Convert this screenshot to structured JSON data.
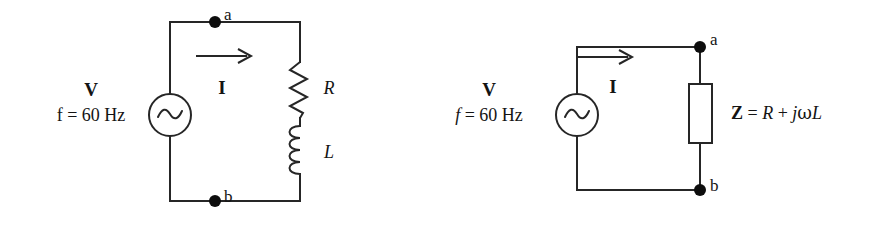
{
  "figure": {
    "type": "circuit-diagram",
    "width": 869,
    "height": 230,
    "background_color": "#ffffff",
    "line_color": "#262626",
    "text_color": "#141414"
  },
  "circuit_left": {
    "name": "series-r-l-circuit",
    "source": {
      "symbol": "ac-source",
      "voltage_label": "V",
      "frequency_label_prefix": "f",
      "frequency_label_equals": "=",
      "frequency_label_value": "60 Hz",
      "frequency_label_full": "f = 60 Hz",
      "frequency_italic_f": false
    },
    "current": {
      "label": "I",
      "arrow_direction": "right"
    },
    "nodes": [
      {
        "label": "a",
        "position": "top"
      },
      {
        "label": "b",
        "position": "bottom"
      }
    ],
    "components": [
      {
        "symbol": "resistor",
        "label": "R"
      },
      {
        "symbol": "inductor",
        "label": "L"
      }
    ]
  },
  "circuit_right": {
    "name": "equivalent-impedance-circuit",
    "source": {
      "symbol": "ac-source",
      "voltage_label": "V",
      "frequency_label_prefix": "f",
      "frequency_label_equals": "=",
      "frequency_label_value": "60 Hz",
      "frequency_label_full": "f = 60 Hz",
      "frequency_italic_f": true
    },
    "current": {
      "label": "I",
      "arrow_direction": "right"
    },
    "nodes": [
      {
        "label": "a",
        "position": "top"
      },
      {
        "label": "b",
        "position": "bottom"
      }
    ],
    "components": [
      {
        "symbol": "impedance-box",
        "label_symbol": "Z",
        "label_equals": "=",
        "label_real": "R",
        "label_plus": "+",
        "label_j": "j",
        "label_omega": "ω",
        "label_inductance": "L",
        "label_full": "Z = R + jωL"
      }
    ]
  }
}
